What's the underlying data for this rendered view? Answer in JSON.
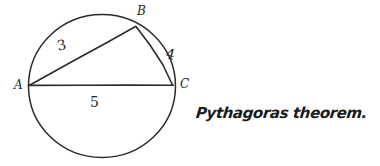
{
  "canvas": {
    "width": 380,
    "height": 166,
    "background": "#ffffff",
    "ink_color": "#2b2b2b"
  },
  "figure": {
    "name": "circle-with-inscribed-right-triangle",
    "circle": {
      "cx": 102,
      "cy": 86,
      "r": 72
    },
    "vertices": [
      {
        "id": "A",
        "label": "A",
        "x": 29,
        "y": 85,
        "label_x": 14,
        "label_y": 80
      },
      {
        "id": "B",
        "label": "B",
        "x": 136,
        "y": 26,
        "label_x": 137,
        "label_y": 6
      },
      {
        "id": "C",
        "label": "C",
        "x": 173,
        "y": 85,
        "label_x": 180,
        "label_y": 79
      }
    ],
    "sides": [
      {
        "id": "AB",
        "label": "3",
        "from": "A",
        "to": "B",
        "label_x": 57,
        "label_y": 38
      },
      {
        "id": "BC",
        "label": "4",
        "from": "B",
        "to": "C",
        "label_x": 166,
        "label_y": 47
      },
      {
        "id": "AC",
        "label": "5",
        "from": "A",
        "to": "C",
        "label_x": 90,
        "label_y": 95
      }
    ]
  },
  "annotation": {
    "text": "Pythagoras theorem."
  }
}
